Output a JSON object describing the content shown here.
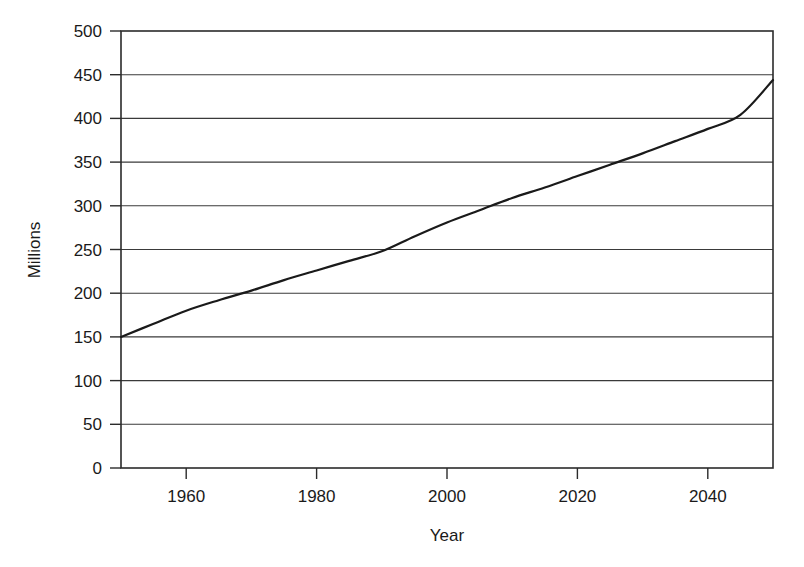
{
  "chart_data": {
    "type": "line",
    "title": "",
    "xlabel": "Year",
    "ylabel": "Millions",
    "xlim": [
      1950,
      2050
    ],
    "ylim": [
      0,
      500
    ],
    "grid": "horizontal",
    "legend": "none",
    "xticks": [
      1960,
      1980,
      2000,
      2020,
      2040
    ],
    "xtick_labels": [
      "1960",
      "1980",
      "2000",
      "2020",
      "2040"
    ],
    "yticks": [
      0,
      50,
      100,
      150,
      200,
      250,
      300,
      350,
      400,
      450,
      500
    ],
    "ytick_labels": [
      "0",
      "50",
      "100",
      "150",
      "200",
      "250",
      "300",
      "350",
      "400",
      "450",
      "500"
    ],
    "series": [
      {
        "name": "Population",
        "color": "#1a1a1a",
        "x": [
          1950,
          1955,
          1960,
          1965,
          1970,
          1975,
          1980,
          1985,
          1990,
          1995,
          2000,
          2005,
          2010,
          2015,
          2020,
          2025,
          2030,
          2035,
          2040,
          2045,
          2050
        ],
        "values": [
          150,
          165,
          180,
          192,
          203,
          215,
          226,
          237,
          248,
          265,
          281,
          295,
          309,
          321,
          334,
          347,
          360,
          374,
          388,
          404,
          444
        ]
      }
    ]
  },
  "axes": {
    "x_title": "Year",
    "y_title": "Millions"
  }
}
